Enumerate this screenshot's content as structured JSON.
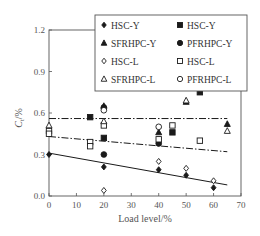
{
  "chart_data": {
    "type": "scatter",
    "title": "",
    "xlabel": "Load level/%",
    "ylabel": "C_t/%",
    "ylabel_main": "C",
    "ylabel_sub": "t",
    "ylabel_suffix": "/%",
    "xlim": [
      0,
      70
    ],
    "ylim": [
      0.0,
      1.2
    ],
    "xticks": [
      0,
      10,
      20,
      30,
      40,
      50,
      60,
      70
    ],
    "xtick_labels": [
      "0",
      "10",
      "20",
      "30",
      "40",
      "50",
      "60",
      "70"
    ],
    "yticks": [
      0.0,
      0.3,
      0.6,
      0.9,
      1.2
    ],
    "ytick_labels": [
      "0.0",
      "0.3",
      "0.6",
      "0.9",
      "1.2"
    ],
    "grid": false,
    "legend_position": "upper right (inside, overlapping frame)",
    "series": [
      {
        "name": "HSC-Y",
        "marker": "filled-diamond",
        "points": [
          [
            0,
            0.3
          ],
          [
            20,
            0.21
          ],
          [
            40,
            0.19
          ],
          [
            50,
            0.15
          ],
          [
            60,
            0.06
          ]
        ]
      },
      {
        "name": "HSC-Y",
        "marker": "filled-square",
        "points": [
          [
            15,
            0.57
          ],
          [
            20,
            0.42
          ],
          [
            45,
            0.46
          ],
          [
            55,
            0.75
          ]
        ]
      },
      {
        "name": "SFRHPC-Y",
        "marker": "filled-triangle",
        "points": [
          [
            20,
            0.65
          ],
          [
            40,
            0.46
          ],
          [
            50,
            0.68
          ],
          [
            65,
            0.52
          ]
        ]
      },
      {
        "name": "PFRHPC-Y",
        "marker": "filled-circle",
        "points": [
          [
            20,
            0.3
          ],
          [
            20,
            0.64
          ],
          [
            40,
            0.38
          ]
        ]
      },
      {
        "name": "HSC-L",
        "marker": "open-diamond",
        "points": [
          [
            20,
            0.04
          ],
          [
            40,
            0.25
          ],
          [
            50,
            0.2
          ],
          [
            60,
            0.11
          ]
        ]
      },
      {
        "name": "HSC-L",
        "marker": "open-square",
        "points": [
          [
            0,
            0.47
          ],
          [
            0,
            0.45
          ],
          [
            15,
            0.39
          ],
          [
            15,
            0.36
          ],
          [
            20,
            0.51
          ],
          [
            40,
            0.41
          ],
          [
            45,
            0.51
          ],
          [
            55,
            0.4
          ]
        ]
      },
      {
        "name": "SFRHPC-L",
        "marker": "open-triangle",
        "points": [
          [
            0,
            0.51
          ],
          [
            20,
            0.54
          ],
          [
            50,
            0.69
          ],
          [
            65,
            0.47
          ]
        ]
      },
      {
        "name": "PFRHPC-L",
        "marker": "open-circle",
        "points": [
          [
            20,
            0.62
          ],
          [
            40,
            0.5
          ]
        ]
      }
    ],
    "fit_lines": [
      {
        "style": "dash-dot",
        "from": [
          0,
          0.56
        ],
        "to": [
          65,
          0.56
        ]
      },
      {
        "style": "dash-dot",
        "from": [
          0,
          0.43
        ],
        "to": [
          65,
          0.32
        ]
      },
      {
        "style": "solid",
        "from": [
          0,
          0.31
        ],
        "to": [
          65,
          0.08
        ]
      }
    ],
    "legend": [
      {
        "label": "HSC-Y",
        "marker": "filled-diamond"
      },
      {
        "label": "HSC-Y",
        "marker": "filled-square"
      },
      {
        "label": "SFRHPC-Y",
        "marker": "filled-triangle"
      },
      {
        "label": "PFRHPC-Y",
        "marker": "filled-circle"
      },
      {
        "label": "HSC-L",
        "marker": "open-diamond"
      },
      {
        "label": "HSC-L",
        "marker": "open-square"
      },
      {
        "label": "SFRHPC-L",
        "marker": "open-triangle"
      },
      {
        "label": "PFRHPC-L",
        "marker": "open-circle"
      }
    ]
  },
  "colors": {
    "ink": "#1a1a1a",
    "axis": "#555555",
    "background": "#ffffff"
  }
}
